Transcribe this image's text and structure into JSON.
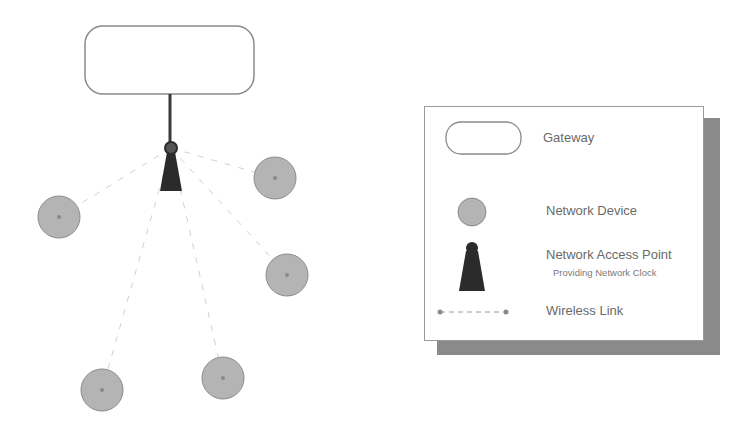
{
  "diagram": {
    "title": "",
    "gateway": {
      "x": 85,
      "y": 26,
      "w": 169,
      "h": 68,
      "r": 18
    },
    "uplink": {
      "x": 170,
      "y1": 94,
      "y2": 143
    },
    "access_point": {
      "cx": 171,
      "cy": 148,
      "r": 6,
      "triangle": {
        "top": 152,
        "bottom": 191,
        "left": 160,
        "right": 182
      }
    },
    "devices": [
      {
        "id": "device-1",
        "cx": 59,
        "cy": 217,
        "r": 21
      },
      {
        "id": "device-2",
        "cx": 275,
        "cy": 178,
        "r": 21
      },
      {
        "id": "device-3",
        "cx": 287,
        "cy": 275,
        "r": 21
      },
      {
        "id": "device-4",
        "cx": 102,
        "cy": 390,
        "r": 21
      },
      {
        "id": "device-5",
        "cx": 223,
        "cy": 378,
        "r": 21
      }
    ],
    "colors": {
      "device_fill": "#b4b4b4",
      "device_stroke": "#8c8c8c",
      "access_point": "#2b2b2b",
      "link": "#d0d0d0",
      "gateway_stroke": "#8a8a8a"
    }
  },
  "legend": {
    "items": [
      {
        "symbol": "gateway",
        "label": "Gateway"
      },
      {
        "symbol": "network-device",
        "label": "Network Device"
      },
      {
        "symbol": "access-point",
        "label": "Network Access Point",
        "sublabel": "Providing Network Clock"
      },
      {
        "symbol": "wireless-link",
        "label": "Wireless Link"
      }
    ]
  }
}
